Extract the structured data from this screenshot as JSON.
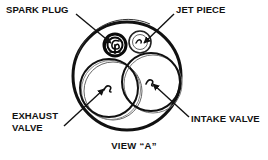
{
  "diagram": {
    "caption": "VIEW “A”",
    "ink_color": "#111111",
    "background_color": "#ffffff",
    "callouts": [
      {
        "id": "spark-plug",
        "label": "SPARK PLUG",
        "lines": [
          "SPARK PLUG"
        ],
        "leader": {
          "from_x": 76,
          "from_y": 14,
          "to_x": 112,
          "to_y": 44
        },
        "target": {
          "x": 115,
          "y": 45,
          "kind": "spark-plug"
        }
      },
      {
        "id": "jet-piece",
        "label": "JET PIECE",
        "lines": [
          "JET PIECE"
        ],
        "leader": {
          "from_x": 174,
          "from_y": 14,
          "to_x": 143,
          "to_y": 44
        },
        "target": {
          "x": 140,
          "y": 42,
          "kind": "jet-piece"
        }
      },
      {
        "id": "exhaust-valve",
        "label": "EXHAUST VALVE",
        "lines": [
          "EXHAUST",
          "VALVE"
        ],
        "leader": {
          "from_x": 66,
          "from_y": 124,
          "to_x": 105,
          "to_y": 88
        },
        "target": {
          "x": 107,
          "y": 86,
          "kind": "valve"
        }
      },
      {
        "id": "intake-valve",
        "label": "INTAKE VALVE",
        "lines": [
          "INTAKE VALVE"
        ],
        "leader": {
          "from_x": 188,
          "from_y": 117,
          "to_x": 152,
          "to_y": 84
        },
        "target": {
          "x": 150,
          "y": 82,
          "kind": "valve"
        }
      }
    ],
    "parts": {
      "chamber": {
        "label": "combustion chamber outline",
        "cx": 127,
        "cy": 76,
        "r": 54
      },
      "exhaust_valve": {
        "label": "exhaust valve",
        "cx": 109,
        "cy": 88,
        "r": 29
      },
      "intake_valve": {
        "label": "intake valve",
        "cx": 151,
        "cy": 82,
        "r": 29
      },
      "spark_plug": {
        "label": "spark plug",
        "cx": 115,
        "cy": 45,
        "r": 11
      },
      "jet_piece": {
        "label": "jet piece",
        "cx": 140,
        "cy": 42,
        "r": 11
      }
    }
  }
}
